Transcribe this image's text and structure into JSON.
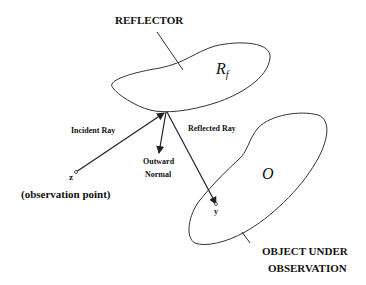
{
  "diagram": {
    "labels": {
      "reflector": "REFLECTOR",
      "reflector_symbol": "R",
      "reflector_subscript": "f",
      "incident_ray": "Incident Ray",
      "reflected_ray": "Reflected Ray",
      "outward": "Outward",
      "normal": "Normal",
      "z": "z",
      "observation_point": "(observation point)",
      "object_symbol": "O",
      "y": "y",
      "object_line1": "OBJECT UNDER",
      "object_line2": "OBSERVATION"
    },
    "colors": {
      "stroke": "#333333",
      "text": "#111111",
      "background": "#ffffff"
    }
  }
}
